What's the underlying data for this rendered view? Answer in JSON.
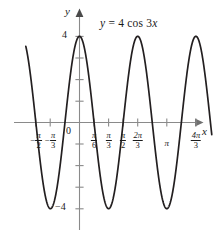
{
  "chart_data": {
    "type": "line",
    "title": "",
    "annotation": "y = 4 cos 3x",
    "function": "y = 4 cos 3x",
    "amplitude": 4,
    "period": "2π/3",
    "xlabel": "x",
    "ylabel": "y",
    "xlim": [
      "-0.62π",
      "1.52π"
    ],
    "ylim": [
      -5.6,
      5.6
    ],
    "grid": false,
    "legend": null,
    "axis_arrows": [
      "x-right",
      "y-up"
    ],
    "origin_label": "0",
    "y_ticks": [
      {
        "value": 4,
        "label": "4"
      },
      {
        "value": 2,
        "label": ""
      },
      {
        "value": -2,
        "label": ""
      },
      {
        "value": -4,
        "label": "−4"
      }
    ],
    "x_ticks": [
      {
        "value_pi": -0.5,
        "num": "π",
        "den": "2",
        "negative": true,
        "label": "−π/2"
      },
      {
        "value_pi": -0.3333,
        "num": "π",
        "den": "3",
        "negative": true,
        "label": "−π/3"
      },
      {
        "value_pi": 0.1667,
        "num": "π",
        "den": "6",
        "negative": false,
        "label": "π/6"
      },
      {
        "value_pi": 0.3333,
        "num": "π",
        "den": "3",
        "negative": false,
        "label": "π/3"
      },
      {
        "value_pi": 0.5,
        "num": "π",
        "den": "2",
        "negative": false,
        "label": "π/2"
      },
      {
        "value_pi": 0.6667,
        "num": "2π",
        "den": "3",
        "negative": false,
        "label": "2π/3"
      },
      {
        "value_pi": 1.0,
        "num": "π",
        "den": "",
        "negative": false,
        "label": "π"
      },
      {
        "value_pi": 1.3333,
        "num": "4π",
        "den": "3",
        "negative": false,
        "label": "4π/3"
      }
    ],
    "maxima_at_pi": [
      -0.6667,
      0,
      0.6667,
      1.3333
    ],
    "minima_at_pi": [
      -0.3333,
      0.3333,
      1.0
    ],
    "zeros_at_pi": [
      -0.5,
      -0.1667,
      0.1667,
      0.5,
      0.8333,
      1.1667
    ],
    "colors": {
      "curve": "#231f20",
      "axis": "#8a8a8a",
      "text": "#1a1a1a",
      "background": "#ffffff"
    }
  },
  "labels": {
    "y_axis_name": "y",
    "x_axis_name": "x",
    "equation_lhs": "y",
    "equation_eq": "=",
    "equation_rhs": "4 cos 3",
    "equation_var": "x",
    "origin": "0",
    "y_max": "4",
    "y_min": "−4"
  }
}
